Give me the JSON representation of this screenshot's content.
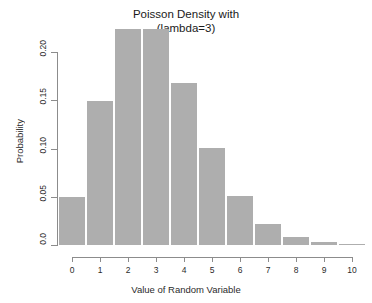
{
  "chart_data": {
    "type": "bar",
    "title": "Poisson Density with\n(lambda=3)",
    "title_line1": "Poisson Density with",
    "title_line2": "(lambda=3)",
    "xlabel": "Value of Random Variable",
    "ylabel": "Probability",
    "categories": [
      "0",
      "1",
      "2",
      "3",
      "4",
      "5",
      "6",
      "7",
      "8",
      "9",
      "10"
    ],
    "values": [
      0.0498,
      0.1494,
      0.224,
      0.224,
      0.168,
      0.1008,
      0.0504,
      0.0216,
      0.0081,
      0.0027,
      0.0008
    ],
    "xlim": [
      0,
      10
    ],
    "ylim": [
      0.0,
      0.2
    ],
    "ytick_labels": [
      "0.0",
      "0.05",
      "0.10",
      "0.15",
      "0.20"
    ],
    "ytick_values": [
      0.0,
      0.05,
      0.1,
      0.15,
      0.2
    ],
    "xtick_labels": [
      "0",
      "1",
      "2",
      "3",
      "4",
      "5",
      "6",
      "7",
      "8",
      "9",
      "10"
    ],
    "xtick_values": [
      0,
      1,
      2,
      3,
      4,
      5,
      6,
      7,
      8,
      9,
      10
    ],
    "grid": false,
    "legend": false,
    "bar_color": "#aeaeae",
    "axis_color": "#8c8c8c",
    "text_color": "#2b2b2b",
    "background": "#ffffff"
  }
}
